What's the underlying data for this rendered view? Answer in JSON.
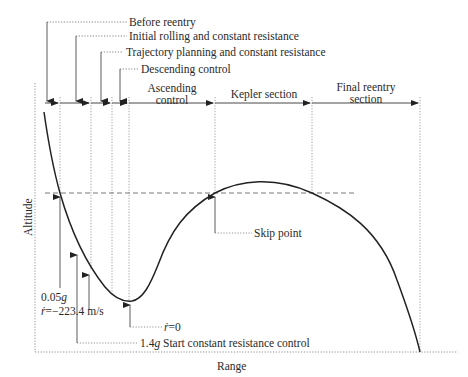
{
  "diagram": {
    "type": "reentry-trajectory-phases",
    "axes": {
      "x_label": "Range",
      "y_label": "Altitude"
    },
    "phase_callouts": [
      {
        "label": "Before reentry"
      },
      {
        "label": "Initial rolling and constant resistance"
      },
      {
        "label": "Trajectory planning and constant resistance"
      },
      {
        "label": "Descending control"
      }
    ],
    "sections": [
      {
        "label_line1": "Ascending",
        "label_line2": "control"
      },
      {
        "label_line1": "Kepler section",
        "label_line2": ""
      },
      {
        "label_line1": "Final reentry",
        "label_line2": "section"
      }
    ],
    "annotations": {
      "g005": "0.05g",
      "rdot_value": "ṙ=−223.4 m/s",
      "rdot_prefix": "ṙ",
      "rdot_suffix": "=−223.4 m/s",
      "rdot_zero_prefix": "ṙ",
      "rdot_zero_suffix": "=0",
      "g14_prefix": "1.4",
      "g14_unit": "g",
      "g14_suffix": " Start constant resistance control",
      "g005_num": "0.05",
      "g005_unit": "g",
      "skip_point": "Skip point"
    }
  }
}
